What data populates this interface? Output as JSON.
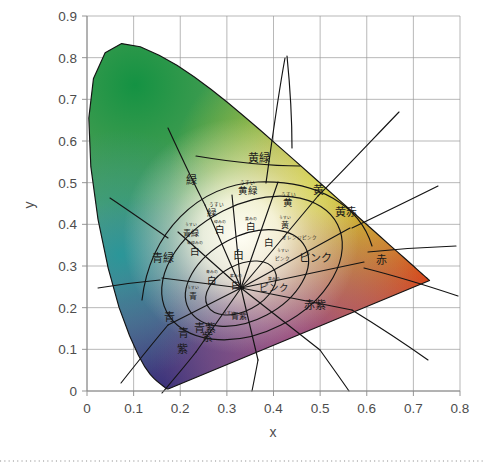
{
  "chart_data": {
    "type": "scatter",
    "title": "",
    "subtitle": "",
    "xlabel": "x",
    "ylabel": "y",
    "xlim": [
      0,
      0.8
    ],
    "ylim": [
      0,
      0.9
    ],
    "grid": true,
    "legend": "none",
    "x_ticks": [
      "0",
      "0.1",
      "0.2",
      "0.3",
      "0.4",
      "0.5",
      "0.6",
      "0.7",
      "0.8"
    ],
    "x_tick_values": [
      0,
      0.1,
      0.2,
      0.3,
      0.4,
      0.5,
      0.6,
      0.7,
      0.8
    ],
    "y_ticks": [
      "0",
      "0.1",
      "0.2",
      "0.3",
      "0.4",
      "0.5",
      "0.6",
      "0.7",
      "0.8",
      "0.9"
    ],
    "y_tick_values": [
      0,
      0.1,
      0.2,
      0.3,
      0.4,
      0.5,
      0.6,
      0.7,
      0.8,
      0.9
    ],
    "spectral_locus": [
      [
        0.1741,
        0.005
      ],
      [
        0.174,
        0.005
      ],
      [
        0.1738,
        0.0049
      ],
      [
        0.1736,
        0.0049
      ],
      [
        0.1733,
        0.0048
      ],
      [
        0.173,
        0.0048
      ],
      [
        0.1726,
        0.0048
      ],
      [
        0.1721,
        0.0048
      ],
      [
        0.1714,
        0.0051
      ],
      [
        0.1703,
        0.0058
      ],
      [
        0.1689,
        0.0069
      ],
      [
        0.1669,
        0.0086
      ],
      [
        0.1644,
        0.0109
      ],
      [
        0.1611,
        0.0138
      ],
      [
        0.1566,
        0.0177
      ],
      [
        0.151,
        0.0227
      ],
      [
        0.144,
        0.0297
      ],
      [
        0.1355,
        0.0399
      ],
      [
        0.1241,
        0.0578
      ],
      [
        0.1096,
        0.0868
      ],
      [
        0.0913,
        0.1327
      ],
      [
        0.0687,
        0.2007
      ],
      [
        0.0454,
        0.295
      ],
      [
        0.0235,
        0.4127
      ],
      [
        0.0082,
        0.5384
      ],
      [
        0.0039,
        0.6548
      ],
      [
        0.0139,
        0.7502
      ],
      [
        0.0389,
        0.812
      ],
      [
        0.0743,
        0.8338
      ],
      [
        0.1142,
        0.8262
      ],
      [
        0.1547,
        0.8059
      ],
      [
        0.1929,
        0.7816
      ],
      [
        0.2296,
        0.7543
      ],
      [
        0.2658,
        0.7243
      ],
      [
        0.3016,
        0.6923
      ],
      [
        0.3373,
        0.6589
      ],
      [
        0.3731,
        0.6245
      ],
      [
        0.4087,
        0.5896
      ],
      [
        0.4441,
        0.5547
      ],
      [
        0.4788,
        0.5202
      ],
      [
        0.5125,
        0.4866
      ],
      [
        0.5448,
        0.4544
      ],
      [
        0.5752,
        0.4242
      ],
      [
        0.6029,
        0.3965
      ],
      [
        0.627,
        0.3725
      ],
      [
        0.6482,
        0.3514
      ],
      [
        0.6658,
        0.334
      ],
      [
        0.6801,
        0.3197
      ],
      [
        0.6915,
        0.3083
      ],
      [
        0.7006,
        0.2993
      ],
      [
        0.7079,
        0.292
      ],
      [
        0.714,
        0.2859
      ],
      [
        0.719,
        0.2809
      ],
      [
        0.723,
        0.277
      ],
      [
        0.726,
        0.274
      ],
      [
        0.7283,
        0.2717
      ],
      [
        0.73,
        0.27
      ],
      [
        0.7311,
        0.2689
      ],
      [
        0.732,
        0.268
      ],
      [
        0.7327,
        0.2673
      ],
      [
        0.7334,
        0.2666
      ],
      [
        0.734,
        0.266
      ],
      [
        0.7344,
        0.2656
      ],
      [
        0.7346,
        0.2654
      ],
      [
        0.7347,
        0.2653
      ]
    ],
    "white_point": [
      0.3333,
      0.3333
    ],
    "regions": [
      {
        "id": "green",
        "label": "緑",
        "x": 0.225,
        "y": 0.505,
        "size": "lg"
      },
      {
        "id": "yellow-green",
        "label": "黄緑",
        "x": 0.368,
        "y": 0.557,
        "size": "lg"
      },
      {
        "id": "yellow",
        "label": "黄",
        "x": 0.497,
        "y": 0.48,
        "size": "lg"
      },
      {
        "id": "yellow-red",
        "label": "黄赤",
        "x": 0.555,
        "y": 0.428,
        "size": "lg"
      },
      {
        "id": "red",
        "label": "赤",
        "x": 0.632,
        "y": 0.312,
        "size": "lg"
      },
      {
        "id": "pink",
        "label": "ピンク",
        "x": 0.49,
        "y": 0.318,
        "size": "lg"
      },
      {
        "id": "red-purple",
        "label": "赤紫",
        "x": 0.49,
        "y": 0.205,
        "size": "lg"
      },
      {
        "id": "purple",
        "label": "紫",
        "x": 0.205,
        "y": 0.098,
        "size": "lg"
      },
      {
        "id": "blue-purple",
        "label": "青紫",
        "x": 0.253,
        "y": 0.148,
        "size": "lg"
      },
      {
        "id": "blue",
        "label": "青",
        "x": 0.178,
        "y": 0.175,
        "size": "lg"
      },
      {
        "id": "blue-green",
        "label": "青緑",
        "x": 0.164,
        "y": 0.318,
        "size": "lg"
      },
      {
        "id": "light-green",
        "label": "緑",
        "x": 0.268,
        "y": 0.425,
        "size": "md"
      },
      {
        "id": "light-green-pre",
        "label": "うすい",
        "x": 0.277,
        "y": 0.447,
        "size": "xs"
      },
      {
        "id": "light-yellow-green",
        "label": "黄緑",
        "x": 0.345,
        "y": 0.478,
        "size": "md"
      },
      {
        "id": "lyg-pre",
        "label": "うすい",
        "x": 0.345,
        "y": 0.5,
        "size": "xs"
      },
      {
        "id": "light-yellow",
        "label": "黄",
        "x": 0.432,
        "y": 0.45,
        "size": "md"
      },
      {
        "id": "ly-pre",
        "label": "うすい",
        "x": 0.432,
        "y": 0.472,
        "size": "xs"
      },
      {
        "id": "light-yellow2",
        "label": "黄",
        "x": 0.424,
        "y": 0.397,
        "size": "sm"
      },
      {
        "id": "ly2-pre",
        "label": "うすい",
        "x": 0.424,
        "y": 0.415,
        "size": "xxs"
      },
      {
        "id": "orange-pink",
        "label": "オレンジピンク",
        "x": 0.455,
        "y": 0.368,
        "size": "xs"
      },
      {
        "id": "light-pink",
        "label": "ピンク",
        "x": 0.42,
        "y": 0.318,
        "size": "xs"
      },
      {
        "id": "lp-pre",
        "label": "うすい",
        "x": 0.42,
        "y": 0.337,
        "size": "xxs"
      },
      {
        "id": "pink2",
        "label": "ピンク",
        "x": 0.4,
        "y": 0.245,
        "size": "md"
      },
      {
        "id": "pink2-pre",
        "label": "黄みの",
        "x": 0.4,
        "y": 0.268,
        "size": "xxs"
      },
      {
        "id": "white-center",
        "label": "白",
        "x": 0.325,
        "y": 0.325,
        "size": "lg"
      },
      {
        "id": "white-upper",
        "label": "白",
        "x": 0.352,
        "y": 0.392,
        "size": "md"
      },
      {
        "id": "white-upper-pre",
        "label": "黄みの",
        "x": 0.352,
        "y": 0.412,
        "size": "xxs"
      },
      {
        "id": "white-right",
        "label": "白",
        "x": 0.39,
        "y": 0.353,
        "size": "md"
      },
      {
        "id": "white-left",
        "label": "白",
        "x": 0.285,
        "y": 0.385,
        "size": "md"
      },
      {
        "id": "white-left-pre",
        "label": "緑みの",
        "x": 0.285,
        "y": 0.405,
        "size": "xxs"
      },
      {
        "id": "white-low-left",
        "label": "白",
        "x": 0.268,
        "y": 0.262,
        "size": "md"
      },
      {
        "id": "white-low-left-pre",
        "label": "青みの",
        "x": 0.268,
        "y": 0.285,
        "size": "xxs"
      },
      {
        "id": "white-low",
        "label": "白",
        "x": 0.32,
        "y": 0.252,
        "size": "md"
      },
      {
        "id": "white-low-pre",
        "label": "紫みの",
        "x": 0.32,
        "y": 0.275,
        "size": "xxs"
      },
      {
        "id": "white-far-left",
        "label": "白",
        "x": 0.232,
        "y": 0.332,
        "size": "md"
      },
      {
        "id": "white-far-left-pre",
        "label": "青緑みの",
        "x": 0.232,
        "y": 0.355,
        "size": "xxs"
      },
      {
        "id": "light-blue-green",
        "label": "青緑",
        "x": 0.222,
        "y": 0.378,
        "size": "sm"
      },
      {
        "id": "lbg-pre",
        "label": "うすい",
        "x": 0.222,
        "y": 0.398,
        "size": "xxs"
      },
      {
        "id": "light-blue",
        "label": "青",
        "x": 0.228,
        "y": 0.228,
        "size": "sm"
      },
      {
        "id": "lb-pre",
        "label": "うすい",
        "x": 0.228,
        "y": 0.248,
        "size": "xxs"
      },
      {
        "id": "light-blue-purple",
        "label": "青紫",
        "x": 0.327,
        "y": 0.178,
        "size": "sm"
      },
      {
        "id": "lbp-pre",
        "label": "うすい",
        "x": 0.305,
        "y": 0.188,
        "size": "xxs"
      },
      {
        "id": "blue-lower",
        "label": "青",
        "x": 0.208,
        "y": 0.138,
        "size": "lg"
      },
      {
        "id": "purple-mid",
        "label": "紫",
        "x": 0.258,
        "y": 0.128,
        "size": "lg"
      }
    ]
  }
}
